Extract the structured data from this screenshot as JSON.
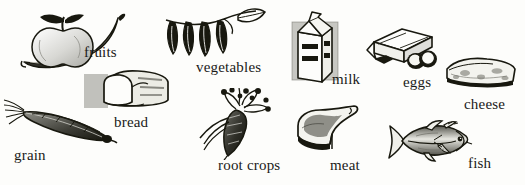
{
  "figure": {
    "style": "pen-and-ink engraving",
    "background_color": "#fdfdfb",
    "ink_color": "#1a1a18",
    "shade_color": "#6f6f6a",
    "items": [
      {
        "id": "fruits",
        "label": "fruits",
        "icon": "apple-and-banana-icon"
      },
      {
        "id": "vegetables",
        "label": "vegetables",
        "icon": "pea-pods-on-vine-icon"
      },
      {
        "id": "milk",
        "label": "milk",
        "icon": "milk-carton-icon"
      },
      {
        "id": "eggs",
        "label": "eggs",
        "icon": "egg-carton-icon"
      },
      {
        "id": "cheese",
        "label": "cheese",
        "icon": "cheese-wedge-icon"
      },
      {
        "id": "bread",
        "label": "bread",
        "icon": "bread-loaf-icon"
      },
      {
        "id": "grain",
        "label": "grain",
        "icon": "grain-ear-icon"
      },
      {
        "id": "root_crops",
        "label": "root crops",
        "icon": "carrot-icon"
      },
      {
        "id": "meat",
        "label": "meat",
        "icon": "meat-cut-icon"
      },
      {
        "id": "fish",
        "label": "fish",
        "icon": "fish-icon"
      }
    ]
  }
}
